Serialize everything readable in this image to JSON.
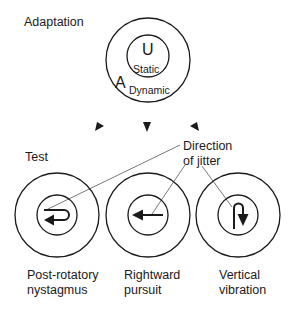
{
  "adaptation": {
    "title": "Adaptation",
    "inner_letter": "U",
    "inner_label": "Static",
    "outer_letter": "A",
    "outer_label": "Dynamic"
  },
  "test": {
    "title": "Test",
    "annotation_line1": "Direction",
    "annotation_line2": "of jitter",
    "conditions": [
      {
        "line1": "Post-rotatory",
        "line2": "nystagmus",
        "jitter_icon": "hook-arrow-left"
      },
      {
        "line1": "Rightward",
        "line2": "pursuit",
        "jitter_icon": "arrow-left"
      },
      {
        "line1": "Vertical",
        "line2": "vibration",
        "jitter_icon": "hook-arrow-down"
      }
    ]
  },
  "colors": {
    "stroke": "#1a1a1a",
    "leader_line": "#555555"
  }
}
